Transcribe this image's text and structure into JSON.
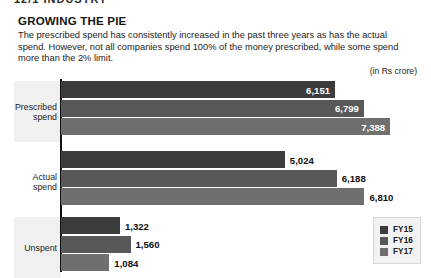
{
  "page_header": {
    "clipped_text": "12/1   INDUSTRY"
  },
  "figure": {
    "title": "GROWING THE PIE",
    "subtitle": "The prescribed spend has consistently increased in the past three years as has the actual spend. However, not all companies spend 100% of the money prescribed, while some spend more than the 2% limit.",
    "units": "(in Rs crore)"
  },
  "legend": {
    "items": [
      {
        "label": "FY15",
        "color": "#3c3c3c"
      },
      {
        "label": "FY16",
        "color": "#585858"
      },
      {
        "label": "FY17",
        "color": "#6f6f6f"
      }
    ]
  },
  "chart_data": {
    "type": "bar",
    "orientation": "horizontal",
    "title": "GROWING THE PIE",
    "subtitle": "The prescribed spend has consistently increased in the past three years as has the actual spend. However, not all companies spend 100% of the money prescribed, while some spend more than the 2% limit.",
    "xlabel": "",
    "ylabel": "",
    "units": "(in Rs crore)",
    "grid": false,
    "legend_position": "bottom-right",
    "xlim": [
      0,
      7900
    ],
    "categories": [
      "Prescribed spend",
      "Actual spend",
      "Unspent"
    ],
    "series": [
      {
        "name": "FY15",
        "color": "#3c3c3c",
        "values": [
          6151,
          5024,
          1322
        ],
        "labels": [
          "6,151",
          "5,024",
          "1,322"
        ],
        "label_placement": [
          "inside",
          "outside",
          "outside"
        ]
      },
      {
        "name": "FY16",
        "color": "#585858",
        "values": [
          6799,
          6188,
          1560
        ],
        "labels": [
          "6,799",
          "6,188",
          "1,560"
        ],
        "label_placement": [
          "inside",
          "outside",
          "outside"
        ]
      },
      {
        "name": "FY17",
        "color": "#6f6f6f",
        "values": [
          7388,
          6810,
          1084
        ],
        "labels": [
          "7,388",
          "6,810",
          "1,084"
        ],
        "label_placement": [
          "inside",
          "outside",
          "outside"
        ]
      }
    ]
  }
}
